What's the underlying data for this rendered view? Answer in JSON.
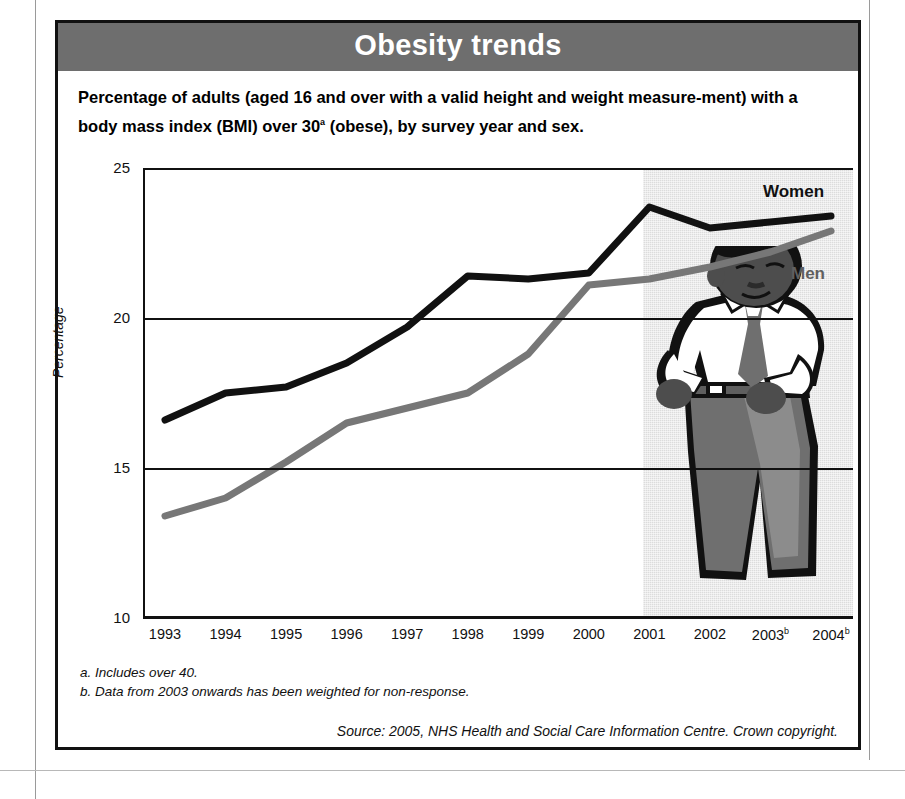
{
  "figure": {
    "banner_title": "Obesity trends",
    "subtitle_part1": "Percentage of adults (aged 16 and over with a valid height and weight measure-ment) with a body mass index (BMI) over 30",
    "subtitle_marker": "a",
    "subtitle_part2": " (obese), by survey year and sex.",
    "banner_color": "#6e6e6e",
    "women_color": "#111111",
    "men_color": "#777777"
  },
  "footnotes": [
    "a. Includes over 40.",
    "b. Data from 2003 onwards has been weighted for non-response."
  ],
  "source": "Source: 2005, NHS Health and Social Care Information Centre. Crown copyright.",
  "illustration": {
    "name": "man-holding-oversized-trousers"
  },
  "chart_data": {
    "type": "line",
    "title": "Obesity trends",
    "xlabel": "",
    "ylabel": "Percentage",
    "ylim": [
      10,
      25
    ],
    "yticks": [
      10,
      15,
      20,
      25
    ],
    "gridlines": [
      15,
      20
    ],
    "grid": true,
    "legend_position": "inline-right",
    "x": [
      1993,
      1994,
      1995,
      1996,
      1997,
      1998,
      1999,
      2000,
      2001,
      2002,
      2003,
      2004
    ],
    "categories": [
      "1993",
      "1994",
      "1995",
      "1996",
      "1997",
      "1998",
      "1999",
      "2000",
      "2001",
      "2002",
      "2003",
      "2004"
    ],
    "tick_markers": {
      "2003": "b",
      "2004": "b"
    },
    "series": [
      {
        "name": "Women",
        "color": "#111111",
        "values": [
          16.6,
          17.5,
          17.7,
          18.5,
          19.7,
          21.4,
          21.3,
          21.5,
          23.7,
          23.0,
          23.2,
          23.4
        ]
      },
      {
        "name": "Men",
        "color": "#777777",
        "values": [
          13.4,
          14.0,
          15.2,
          16.5,
          17.0,
          17.5,
          18.8,
          21.1,
          21.3,
          21.7,
          22.2,
          22.9
        ]
      }
    ]
  }
}
